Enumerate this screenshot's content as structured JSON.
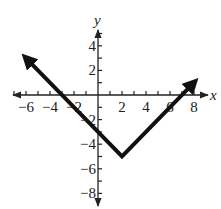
{
  "chart_data": {
    "type": "line",
    "title": "",
    "xlabel": "x",
    "ylabel": "y",
    "xlim": [
      -7,
      9
    ],
    "ylim": [
      -9,
      5
    ],
    "grid": false,
    "x_tick_labels": [
      "-6",
      "-4",
      "-2",
      "2",
      "4",
      "6",
      "8"
    ],
    "y_tick_labels": [
      "4",
      "2",
      "-2",
      "-4",
      "-6",
      "-8"
    ],
    "series": [
      {
        "name": "y = |x - 2| - 5",
        "x": [
          -6,
          2,
          8
        ],
        "y": [
          3,
          -5,
          1
        ],
        "arrows_at_ends": true
      }
    ],
    "vertex": [
      2,
      -5
    ]
  },
  "labels": {
    "x_axis": "x",
    "y_axis": "y",
    "x_ticks": [
      {
        "value": -6,
        "text": "−6"
      },
      {
        "value": -4,
        "text": "−4"
      },
      {
        "value": -2,
        "text": "−2"
      },
      {
        "value": 2,
        "text": "2"
      },
      {
        "value": 4,
        "text": "4"
      },
      {
        "value": 6,
        "text": "6"
      },
      {
        "value": 8,
        "text": "8"
      }
    ],
    "y_ticks": [
      {
        "value": 4,
        "text": "4"
      },
      {
        "value": 2,
        "text": "2"
      },
      {
        "value": -2,
        "text": "−2"
      },
      {
        "value": -4,
        "text": "−4"
      },
      {
        "value": -6,
        "text": "−6"
      },
      {
        "value": -8,
        "text": "−8"
      }
    ]
  }
}
